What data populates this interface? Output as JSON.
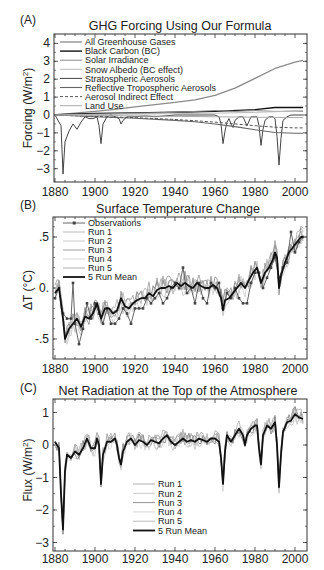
{
  "chart_data": [
    {
      "panel_label": "(A)",
      "type": "line",
      "title": "GHG Forcing Using Our Formula",
      "xlabel": "",
      "ylabel": "Forcing (W/m²)",
      "ylabel_main": "Forcing (W/m",
      "ylabel_sup": "2",
      "ylabel_end": ")",
      "xlim": [
        1880,
        2004
      ],
      "ylim": [
        -3.4,
        4.6
      ],
      "xticks": [
        1880,
        1900,
        1920,
        1940,
        1960,
        1980,
        2000
      ],
      "yticks": [
        4,
        3,
        2,
        1,
        0,
        -1,
        -2,
        -3
      ],
      "ytick_labels": [
        "4",
        "3",
        "2",
        "1",
        "0",
        "−1",
        "−2",
        "−3"
      ],
      "grid": false,
      "legend_position": "upper-left",
      "series": [
        {
          "name": "All Greenhouse Gases",
          "color": "#8a8a8a",
          "width": 1.3,
          "dash": "",
          "x": [
            1880,
            1890,
            1900,
            1910,
            1920,
            1930,
            1940,
            1950,
            1960,
            1970,
            1980,
            1990,
            2000,
            2004
          ],
          "values": [
            0.0,
            0.1,
            0.2,
            0.32,
            0.45,
            0.58,
            0.7,
            0.85,
            1.1,
            1.5,
            2.05,
            2.6,
            2.95,
            3.05
          ]
        },
        {
          "name": "Black Carbon (BC)",
          "color": "#111111",
          "width": 1.4,
          "dash": "",
          "x": [
            1880,
            1900,
            1920,
            1940,
            1960,
            1980,
            1990,
            2004
          ],
          "values": [
            0.02,
            0.08,
            0.12,
            0.15,
            0.2,
            0.3,
            0.42,
            0.42
          ]
        },
        {
          "name": "Solar Irradiance",
          "color": "#8a8a8a",
          "width": 1.0,
          "dash": "",
          "x": [
            1880,
            1900,
            1920,
            1940,
            1950,
            1960,
            1970,
            1980,
            1990,
            2000,
            2004
          ],
          "values": [
            0.0,
            0.05,
            0.1,
            0.15,
            0.2,
            0.25,
            0.2,
            0.25,
            0.2,
            0.22,
            0.2
          ]
        },
        {
          "name": "Snow Albedo (BC effect)",
          "color": "#bbbbbb",
          "width": 1.0,
          "dash": "",
          "x": [
            1880,
            1920,
            1960,
            1980,
            1995,
            2004
          ],
          "values": [
            0.0,
            0.05,
            0.1,
            0.15,
            0.2,
            0.25
          ]
        },
        {
          "name": "Stratospheric Aerosols",
          "color": "#444444",
          "width": 1.0,
          "dash": "",
          "x": [
            1880,
            1883,
            1884,
            1885,
            1887,
            1889,
            1891,
            1893,
            1895,
            1897,
            1899,
            1901,
            1902,
            1903,
            1904,
            1906,
            1908,
            1910,
            1912,
            1913,
            1914,
            1916,
            1920,
            1925,
            1930,
            1935,
            1940,
            1950,
            1960,
            1962,
            1963,
            1964,
            1965,
            1966,
            1967,
            1968,
            1969,
            1970,
            1972,
            1974,
            1976,
            1978,
            1980,
            1981,
            1982,
            1983,
            1984,
            1985,
            1987,
            1989,
            1990,
            1991,
            1992,
            1993,
            1994,
            1996,
            1998,
            2000,
            2004
          ],
          "values": [
            0.0,
            -0.6,
            -3.3,
            -1.5,
            -0.9,
            -0.5,
            -0.8,
            -0.4,
            -0.1,
            -0.2,
            -0.2,
            -0.1,
            -0.6,
            -1.6,
            -0.5,
            -0.1,
            0.0,
            -0.1,
            -0.2,
            -0.5,
            -0.3,
            -0.1,
            -0.1,
            -0.05,
            -0.1,
            -0.05,
            0.0,
            0.0,
            0.0,
            -0.1,
            -0.5,
            -1.6,
            -0.9,
            -0.4,
            -0.2,
            -0.5,
            -0.7,
            -0.3,
            -0.1,
            -0.1,
            -0.6,
            -0.1,
            -0.1,
            -0.1,
            -0.6,
            -1.7,
            -0.8,
            -0.3,
            -0.1,
            -0.1,
            -0.2,
            -1.2,
            -2.8,
            -1.3,
            -0.3,
            -0.1,
            0.0,
            0.0,
            0.0
          ]
        },
        {
          "name": "Reflective Tropospheric Aerosols",
          "color": "#666666",
          "width": 1.1,
          "dash": "",
          "x": [
            1880,
            1900,
            1920,
            1940,
            1950,
            1960,
            1970,
            1980,
            1990,
            2000,
            2004
          ],
          "values": [
            0.0,
            -0.1,
            -0.18,
            -0.3,
            -0.38,
            -0.5,
            -0.65,
            -0.82,
            -0.98,
            -1.02,
            -1.02
          ]
        },
        {
          "name": "Aerosol Indirect Effect",
          "color": "#555555",
          "width": 1.0,
          "dash": "3,2",
          "x": [
            1880,
            1900,
            1920,
            1940,
            1950,
            1960,
            1970,
            1980,
            1990,
            2000,
            2004
          ],
          "values": [
            0.0,
            -0.08,
            -0.15,
            -0.25,
            -0.32,
            -0.4,
            -0.5,
            -0.6,
            -0.68,
            -0.72,
            -0.72
          ]
        },
        {
          "name": "Land Use",
          "color": "#aaaaaa",
          "width": 1.0,
          "dash": "",
          "x": [
            1880,
            1920,
            1960,
            2004
          ],
          "values": [
            0.0,
            -0.05,
            -0.1,
            -0.15
          ]
        }
      ]
    },
    {
      "panel_label": "(B)",
      "type": "line",
      "title": "Surface Temperature Change",
      "xlabel": "",
      "ylabel": "ΔT (°C)",
      "xlim": [
        1880,
        2004
      ],
      "ylim": [
        -0.7,
        0.7
      ],
      "xticks": [
        1880,
        1900,
        1920,
        1940,
        1960,
        1980,
        2000
      ],
      "yticks": [
        0.5,
        0.0,
        -0.5
      ],
      "ytick_labels": [
        ".5",
        "0.",
        "-.5"
      ],
      "grid": false,
      "legend_position": "upper-left",
      "series": [
        {
          "name": "Observations",
          "color": "#555555",
          "width": 0.9,
          "marker": "square",
          "x": [
            1880,
            1882,
            1884,
            1886,
            1888,
            1889,
            1890,
            1892,
            1894,
            1896,
            1898,
            1900,
            1902,
            1904,
            1906,
            1908,
            1910,
            1912,
            1914,
            1916,
            1918,
            1920,
            1922,
            1924,
            1926,
            1928,
            1930,
            1932,
            1934,
            1936,
            1938,
            1940,
            1942,
            1944,
            1946,
            1948,
            1950,
            1952,
            1954,
            1956,
            1958,
            1960,
            1962,
            1964,
            1966,
            1968,
            1970,
            1972,
            1974,
            1976,
            1978,
            1980,
            1982,
            1984,
            1986,
            1988,
            1990,
            1992,
            1994,
            1996,
            1998,
            2000,
            2002,
            2004
          ],
          "values": [
            -0.1,
            0.0,
            -0.25,
            -0.3,
            -0.3,
            0.05,
            -0.35,
            -0.55,
            -0.4,
            -0.15,
            -0.3,
            -0.15,
            -0.25,
            -0.35,
            -0.2,
            -0.35,
            -0.35,
            -0.3,
            -0.2,
            -0.25,
            -0.35,
            -0.2,
            -0.2,
            -0.2,
            -0.1,
            -0.15,
            -0.1,
            -0.05,
            -0.15,
            -0.1,
            0.0,
            0.05,
            0.0,
            0.2,
            -0.05,
            0.0,
            -0.15,
            0.05,
            -0.1,
            -0.15,
            0.05,
            0.0,
            0.05,
            -0.2,
            -0.05,
            -0.1,
            0.0,
            -0.1,
            -0.15,
            -0.15,
            0.05,
            0.15,
            0.15,
            0.0,
            0.1,
            0.2,
            0.3,
            0.1,
            0.2,
            0.25,
            0.55,
            0.35,
            0.45,
            0.5
          ]
        },
        {
          "name": "Run 1",
          "color": "#aaaaaa",
          "width": 0.8,
          "offset": 0.05
        },
        {
          "name": "Run 2",
          "color": "#bbbbbb",
          "width": 0.8,
          "offset": -0.05
        },
        {
          "name": "Run 3",
          "color": "#888888",
          "width": 0.8,
          "offset": 0.03
        },
        {
          "name": "Run 4",
          "color": "#cccccc",
          "width": 0.8,
          "offset": -0.03
        },
        {
          "name": "Run 5",
          "color": "#999999",
          "width": 0.8,
          "offset": 0.07
        },
        {
          "name": "5 Run Mean",
          "color": "#111111",
          "width": 1.8,
          "x": [
            1880,
            1882,
            1884,
            1885,
            1887,
            1889,
            1891,
            1893,
            1895,
            1897,
            1899,
            1901,
            1903,
            1905,
            1907,
            1909,
            1911,
            1913,
            1915,
            1917,
            1919,
            1921,
            1923,
            1925,
            1927,
            1929,
            1931,
            1933,
            1935,
            1937,
            1939,
            1941,
            1943,
            1945,
            1947,
            1949,
            1951,
            1953,
            1955,
            1957,
            1959,
            1961,
            1963,
            1964,
            1965,
            1967,
            1969,
            1971,
            1973,
            1975,
            1977,
            1979,
            1981,
            1983,
            1984,
            1985,
            1987,
            1989,
            1990,
            1991,
            1992,
            1993,
            1995,
            1997,
            1999,
            2001,
            2003,
            2004
          ],
          "values": [
            -0.05,
            0.0,
            -0.3,
            -0.5,
            -0.4,
            -0.35,
            -0.3,
            -0.38,
            -0.28,
            -0.3,
            -0.25,
            -0.15,
            -0.3,
            -0.2,
            -0.2,
            -0.25,
            -0.22,
            -0.1,
            -0.18,
            -0.2,
            -0.15,
            -0.12,
            -0.1,
            -0.1,
            -0.05,
            -0.08,
            -0.02,
            0.0,
            0.0,
            0.02,
            0.0,
            0.05,
            0.02,
            0.05,
            0.02,
            0.0,
            0.05,
            0.02,
            0.0,
            0.0,
            0.03,
            0.0,
            -0.1,
            -0.22,
            -0.12,
            -0.1,
            -0.05,
            0.0,
            0.05,
            0.0,
            0.08,
            0.15,
            0.2,
            0.05,
            0.1,
            0.15,
            0.2,
            0.28,
            0.35,
            0.3,
            0.0,
            0.12,
            0.25,
            0.35,
            0.4,
            0.45,
            0.5,
            0.5
          ]
        }
      ]
    },
    {
      "panel_label": "(C)",
      "type": "line",
      "title": "Net Radiation at the Top of the Atmosphere",
      "xlabel": "",
      "ylabel": "Flux (W/m²)",
      "ylabel_main": "Flux (W/m",
      "ylabel_sup": "2",
      "ylabel_end": ")",
      "xlim": [
        1880,
        2004
      ],
      "ylim": [
        -3.0,
        1.4
      ],
      "xticks": [
        1880,
        1900,
        1920,
        1940,
        1960,
        1980,
        2000
      ],
      "yticks": [
        1,
        0,
        -1,
        -2,
        -3
      ],
      "ytick_labels": [
        "1",
        "0",
        "−1",
        "−2",
        "−3"
      ],
      "grid": false,
      "legend_position": "lower-center",
      "series": [
        {
          "name": "Run 1",
          "color": "#999999",
          "width": 0.8,
          "offset": 0.1
        },
        {
          "name": "Run 2",
          "color": "#bbbbbb",
          "width": 0.8,
          "offset": -0.1
        },
        {
          "name": "Run 3",
          "color": "#777777",
          "width": 0.8,
          "offset": 0.06
        },
        {
          "name": "Run 4",
          "color": "#cccccc",
          "width": 0.8,
          "offset": -0.06
        },
        {
          "name": "Run 5",
          "color": "#aaaaaa",
          "width": 0.8,
          "offset": 0.14
        },
        {
          "name": "5 Run Mean",
          "color": "#111111",
          "width": 1.8,
          "x": [
            1880,
            1882,
            1883,
            1884,
            1885,
            1886,
            1888,
            1890,
            1892,
            1894,
            1896,
            1898,
            1900,
            1901,
            1902,
            1903,
            1904,
            1906,
            1908,
            1910,
            1911,
            1912,
            1913,
            1914,
            1916,
            1918,
            1920,
            1922,
            1924,
            1926,
            1928,
            1930,
            1932,
            1934,
            1936,
            1938,
            1940,
            1942,
            1944,
            1946,
            1948,
            1950,
            1952,
            1954,
            1956,
            1958,
            1960,
            1962,
            1963,
            1964,
            1965,
            1966,
            1968,
            1970,
            1972,
            1974,
            1975,
            1976,
            1978,
            1980,
            1981,
            1982,
            1983,
            1984,
            1986,
            1988,
            1990,
            1991,
            1992,
            1993,
            1994,
            1996,
            1998,
            2000,
            2002,
            2004
          ],
          "values": [
            0.1,
            -0.1,
            -1.5,
            -2.6,
            -0.8,
            -0.3,
            -0.4,
            -0.2,
            -0.3,
            -0.1,
            0.2,
            -0.1,
            -0.1,
            0.2,
            0.0,
            -1.2,
            -0.3,
            0.1,
            0.1,
            0.2,
            0.0,
            -0.4,
            -0.6,
            -0.2,
            0.1,
            0.2,
            0.0,
            0.15,
            0.1,
            0.0,
            0.15,
            0.1,
            0.05,
            0.2,
            0.3,
            0.1,
            0.0,
            0.1,
            0.2,
            0.1,
            0.15,
            0.1,
            0.2,
            0.15,
            0.1,
            0.2,
            0.2,
            0.1,
            -0.4,
            -1.2,
            -0.2,
            0.3,
            0.1,
            0.3,
            0.5,
            0.3,
            0.0,
            0.3,
            0.5,
            0.6,
            0.6,
            -0.1,
            -0.6,
            0.3,
            0.6,
            0.5,
            0.7,
            0.0,
            -1.3,
            -0.3,
            0.4,
            0.7,
            0.75,
            0.95,
            0.85,
            0.8
          ]
        }
      ]
    }
  ]
}
